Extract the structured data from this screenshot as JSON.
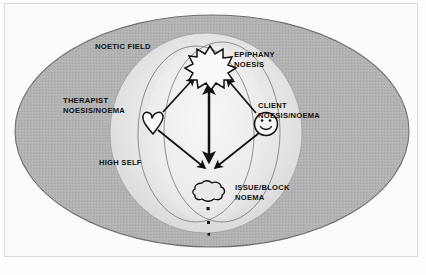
{
  "diagram": {
    "labels": {
      "noetic_field": "NOETIC FIELD",
      "epiphany": "EPIPHANY\nNOESIS",
      "therapist": "THERAPIST\nNOESIS/NOEMA",
      "client": "CLIENT\nNOESIS/NOEMA",
      "high_self": "HIGH SELF",
      "issue_block": "ISSUE/BLOCK\nNOEMA"
    },
    "icons": {
      "epiphany": "starburst-icon",
      "therapist": "heart-icon",
      "client": "smiley-face-icon",
      "issue_block": "cloud-blob-icon",
      "trail": "dots-trail-icon"
    },
    "colors": {
      "page_background": "#fdfdfd",
      "frame_border": "#d9d9d9",
      "outer_ellipse_fill": "#b0b0b0",
      "outer_ellipse_stroke": "#6f6f6f",
      "inner_region_fill": "#e3e3e3",
      "core_ellipse_fill": "#efefef",
      "thin_ellipse_stroke": "#7d7d7d",
      "ink": "#111111"
    },
    "shapes": {
      "outer_ellipse": {
        "cx": 212,
        "cy": 131,
        "rx": 197,
        "ry": 116
      },
      "inner_light_ellipse": {
        "cx": 206,
        "cy": 133,
        "rx": 96,
        "ry": 100
      },
      "core_ellipse": {
        "cx": 208,
        "cy": 133,
        "rx": 62,
        "ry": 88
      },
      "thin_ellipse_left": {
        "cx": 196,
        "cy": 134,
        "rx": 58,
        "ry": 88
      },
      "thin_ellipse_right": {
        "cx": 222,
        "cy": 132,
        "rx": 58,
        "ry": 90
      }
    },
    "arrows": [
      {
        "name": "high-self-vertical",
        "from": "center-low",
        "to": "center-high",
        "double_headed": true
      },
      {
        "name": "therapist-to-epiphany",
        "from": "heart-icon",
        "to": "starburst-icon",
        "double_headed": false
      },
      {
        "name": "client-to-epiphany",
        "from": "smiley-face-icon",
        "to": "starburst-icon",
        "double_headed": false
      },
      {
        "name": "therapist-to-issue",
        "from": "heart-icon",
        "to": "cloud-blob-icon",
        "double_headed": false
      },
      {
        "name": "client-to-issue",
        "from": "smiley-face-icon",
        "to": "cloud-blob-icon",
        "double_headed": false
      }
    ]
  }
}
